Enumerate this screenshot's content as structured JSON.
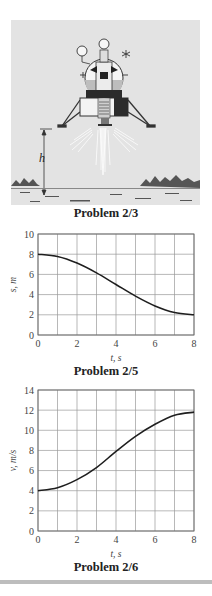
{
  "figures": [
    {
      "id": "lander",
      "caption": "Problem 2/3",
      "label_h": "h",
      "colors": {
        "background": "#e4e4e4",
        "ink": "#333333"
      }
    },
    {
      "id": "s-vs-t",
      "caption": "Problem 2/5"
    },
    {
      "id": "v-vs-t",
      "caption": "Problem 2/6"
    }
  ],
  "chart_data": [
    {
      "type": "line",
      "title": "Problem 2/5",
      "xlabel": "t, s",
      "ylabel": "s, m",
      "x": [
        0,
        1,
        2,
        3,
        4,
        5,
        6,
        7,
        8
      ],
      "series": [
        {
          "name": "s",
          "values": [
            8.0,
            7.77,
            7.12,
            6.15,
            5.0,
            3.85,
            2.88,
            2.23,
            2.0
          ]
        }
      ],
      "xlim": [
        0,
        8
      ],
      "ylim": [
        0,
        10
      ],
      "xticks": [
        0,
        2,
        4,
        6,
        8
      ],
      "yticks": [
        0,
        2,
        4,
        6,
        8,
        10
      ],
      "grid": true,
      "grid_x_step": 1,
      "grid_y_step": 2
    },
    {
      "type": "line",
      "title": "Problem 2/6",
      "xlabel": "t, s",
      "ylabel": "v, m/s",
      "x": [
        0,
        1,
        2,
        3,
        4,
        5,
        6,
        7,
        8
      ],
      "series": [
        {
          "name": "v",
          "values": [
            4.0,
            4.3,
            5.1,
            6.3,
            7.9,
            9.4,
            10.6,
            11.5,
            11.8
          ]
        }
      ],
      "xlim": [
        0,
        8
      ],
      "ylim": [
        0,
        14
      ],
      "xticks": [
        0,
        2,
        4,
        6,
        8
      ],
      "yticks": [
        0,
        2,
        4,
        6,
        8,
        10,
        12,
        14
      ],
      "grid": true,
      "grid_x_step": 1,
      "grid_y_step": 2
    }
  ]
}
